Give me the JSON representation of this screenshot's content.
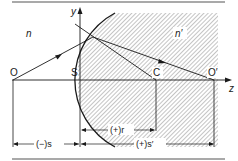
{
  "diagram": {
    "media": {
      "left": "n",
      "right": "n′"
    },
    "points": {
      "object": "O",
      "vertex": "S",
      "center": "C",
      "image": "O′"
    },
    "axes": {
      "vertical": "y",
      "horizontal": "z"
    },
    "dimensions": {
      "object_distance": "(−)s",
      "radius": "(+)r",
      "image_distance": "(+)s′"
    },
    "colors": {
      "line": "#1a1a1a",
      "hatch": "#8a8a8a",
      "rule": "#555555"
    }
  }
}
